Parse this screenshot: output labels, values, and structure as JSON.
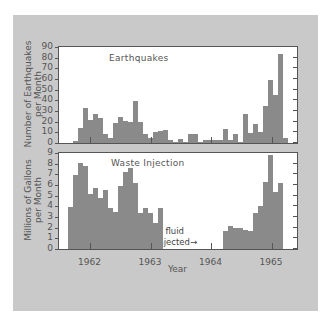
{
  "chart_data": [
    {
      "type": "bar",
      "title": "Earthquakes",
      "xlabel": "Year",
      "ylabel": "Number of Earthquakes per Month",
      "ylim": [
        0,
        90
      ],
      "yticks": [
        0,
        10,
        20,
        30,
        40,
        50,
        60,
        70,
        80,
        90
      ],
      "x_tick_labels": [
        "1962",
        "1963",
        "1964",
        "1965"
      ],
      "grid": false,
      "series": [
        {
          "name": "Earthquakes per month",
          "start_month_index": 0,
          "values": [
            2,
            14,
            33,
            22,
            27,
            23,
            8,
            5,
            19,
            24,
            21,
            20,
            39,
            20,
            8,
            5,
            10,
            11,
            12,
            3,
            1,
            4,
            1,
            8,
            8,
            1,
            3,
            3,
            3,
            3,
            13,
            3,
            8,
            1,
            27,
            9,
            18,
            10,
            35,
            59,
            45,
            83,
            5
          ]
        }
      ]
    },
    {
      "type": "bar",
      "title": "Waste Injection",
      "xlabel": "Year",
      "ylabel": "Millions of Gallons per Month",
      "ylim": [
        0,
        9
      ],
      "yticks": [
        0,
        1,
        2,
        3,
        4,
        5,
        6,
        7,
        8,
        9
      ],
      "x_tick_labels": [
        "1962",
        "1963",
        "1964",
        "1965"
      ],
      "grid": false,
      "annotations": [
        "no fluid",
        "injected"
      ],
      "series": [
        {
          "name": "Injection period 1",
          "start_month_index": -1,
          "values": [
            3.9,
            6.9,
            8.1,
            7.8,
            5.2,
            5.7,
            4.8,
            5.5,
            3.8,
            3.5,
            5.9,
            7.2,
            7.6,
            6.2,
            3.4,
            3.8,
            3.4,
            2.4,
            3.8
          ]
        },
        {
          "name": "Injection period 2",
          "start_month_index": 30,
          "values": [
            1.7,
            2.2,
            2.0,
            2.0,
            1.8,
            1.7,
            3.4,
            4.0,
            6.3,
            8.8,
            5.3,
            6.2
          ]
        }
      ]
    }
  ],
  "labels": {
    "top_title": "Earthquakes",
    "top_ylabel_line1": "Number of Earthquakes",
    "top_ylabel_line2": "per Month",
    "bottom_title": "Waste Injection",
    "bottom_ylabel_line1": "Millions of Gallons",
    "bottom_ylabel_line2": "per Month",
    "xlabel": "Year",
    "annot_line1": "no fluid",
    "annot_line2": "injected",
    "arrow_left": "←",
    "arrow_right": "→"
  }
}
